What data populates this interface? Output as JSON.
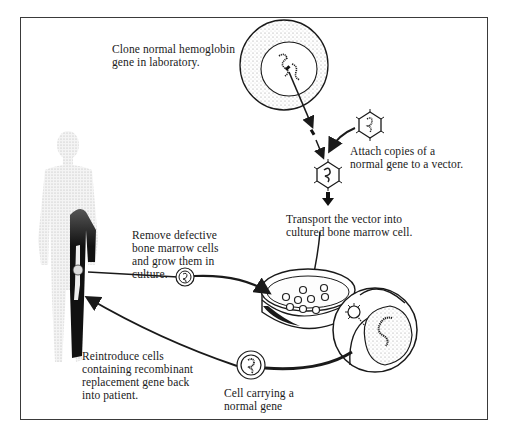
{
  "diagram": {
    "type": "gene therapy process flow",
    "steps": [
      {
        "id": "clone",
        "label": "Clone normal hemoglobin\ngene in laboratory."
      },
      {
        "id": "attach",
        "label": "Attach copies of a\nnormal gene to a vector."
      },
      {
        "id": "transport",
        "label": "Transport the vector into\ncultured bone marrow cell."
      },
      {
        "id": "remove",
        "label": "Remove defective\nbone marrow cells\nand grow them in\nculture."
      },
      {
        "id": "cell_carrying",
        "label": "Cell carrying a\nnormal gene"
      },
      {
        "id": "reintroduce",
        "label": "Reintroduce cells\ncontaining recombinant\nreplacement gene back\ninto patient."
      }
    ],
    "figures": {
      "patient": "human-silhouette",
      "source_cell": "cell-with-gene",
      "vector": "viral-vector",
      "culture": "petri-dish",
      "magnified": "magnified-cell-infection",
      "modified_cell": "cell-with-normal-gene"
    },
    "colors": {
      "ink": "#1a1a1a",
      "frame": "#3a3a3a",
      "stipple": "#9a9a9a",
      "background": "#ffffff"
    }
  }
}
